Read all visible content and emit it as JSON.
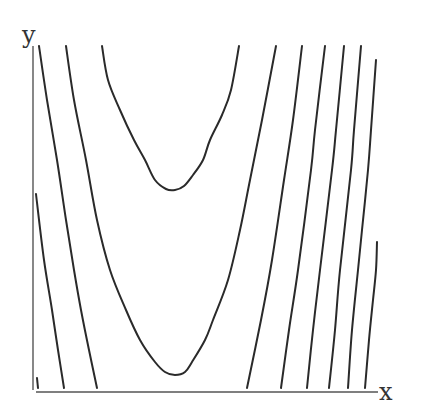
{
  "chart_data": {
    "type": "contour",
    "title": "",
    "xlabel": "x",
    "ylabel": "y",
    "grid": false,
    "legend": null,
    "tick_labels": [],
    "style": {
      "line_color": "#2a2a2a",
      "axis_color": "#555555",
      "background": "#ffffff"
    },
    "contours": [
      {
        "name": "left-short",
        "points": [
          [
            36,
            194
          ],
          [
            44,
            260
          ],
          [
            52,
            310
          ],
          [
            58,
            350
          ],
          [
            64,
            388
          ]
        ]
      },
      {
        "name": "left-1",
        "points": [
          [
            39,
            46
          ],
          [
            47,
            100
          ],
          [
            57,
            160
          ],
          [
            66,
            220
          ],
          [
            74,
            270
          ],
          [
            81,
            310
          ],
          [
            89,
            350
          ],
          [
            97,
            388
          ]
        ]
      },
      {
        "name": "lower-valley",
        "points": [
          [
            66,
            46
          ],
          [
            74,
            100
          ],
          [
            86,
            160
          ],
          [
            97,
            220
          ],
          [
            110,
            270
          ],
          [
            126,
            310
          ],
          [
            140,
            340
          ],
          [
            155,
            362
          ],
          [
            165,
            372
          ],
          [
            175,
            375
          ],
          [
            185,
            372
          ],
          [
            192,
            362
          ],
          [
            205,
            340
          ],
          [
            213,
            320
          ],
          [
            228,
            280
          ],
          [
            240,
            230
          ],
          [
            250,
            180
          ],
          [
            262,
            120
          ],
          [
            276,
            46
          ]
        ]
      },
      {
        "name": "upper-valley",
        "points": [
          [
            102,
            46
          ],
          [
            108,
            80
          ],
          [
            120,
            110
          ],
          [
            134,
            140
          ],
          [
            145,
            160
          ],
          [
            155,
            180
          ],
          [
            166,
            189
          ],
          [
            175,
            190
          ],
          [
            184,
            186
          ],
          [
            193,
            175
          ],
          [
            203,
            160
          ],
          [
            210,
            140
          ],
          [
            222,
            115
          ],
          [
            231,
            90
          ],
          [
            239,
            46
          ]
        ]
      },
      {
        "name": "right-1",
        "points": [
          [
            302,
            46
          ],
          [
            293,
            120
          ],
          [
            284,
            180
          ],
          [
            272,
            260
          ],
          [
            261,
            320
          ],
          [
            247,
            388
          ]
        ]
      },
      {
        "name": "right-2",
        "points": [
          [
            325,
            46
          ],
          [
            315,
            130
          ],
          [
            311,
            170
          ],
          [
            298,
            270
          ],
          [
            289,
            330
          ],
          [
            281,
            388
          ]
        ]
      },
      {
        "name": "right-3",
        "points": [
          [
            344,
            46
          ],
          [
            336,
            130
          ],
          [
            332,
            170
          ],
          [
            320,
            270
          ],
          [
            313,
            330
          ],
          [
            307,
            388
          ]
        ]
      },
      {
        "name": "right-4",
        "points": [
          [
            361,
            46
          ],
          [
            354,
            130
          ],
          [
            351,
            170
          ],
          [
            340,
            270
          ],
          [
            335,
            330
          ],
          [
            329,
            388
          ]
        ]
      },
      {
        "name": "right-5",
        "points": [
          [
            376,
            60
          ],
          [
            371,
            130
          ],
          [
            368,
            170
          ],
          [
            362,
            230
          ],
          [
            358,
            270
          ],
          [
            352,
            330
          ],
          [
            348,
            388
          ]
        ]
      },
      {
        "name": "right-short",
        "points": [
          [
            377,
            242
          ],
          [
            376,
            270
          ],
          [
            373,
            300
          ],
          [
            369,
            340
          ],
          [
            365,
            388
          ]
        ]
      },
      {
        "name": "corner-tick",
        "points": [
          [
            37,
            378
          ],
          [
            38,
            388
          ]
        ]
      }
    ],
    "axes": {
      "x_axis": {
        "from": [
          36,
          392
        ],
        "to": [
          378,
          392
        ]
      },
      "y_axis": {
        "from": [
          33,
          46
        ],
        "to": [
          33,
          390
        ]
      }
    }
  },
  "labels": {
    "x": "x",
    "y": "y"
  }
}
